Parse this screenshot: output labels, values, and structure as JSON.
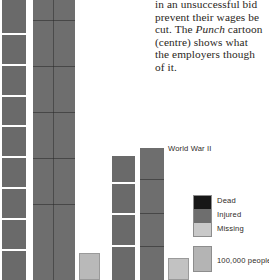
{
  "page": {
    "width": 269,
    "height": 280,
    "background": "#ffffff"
  },
  "body_text": {
    "lines": [
      "in an unsuccessful bid",
      "prevent their wages be",
      "cut. The Punch cartoon",
      "(centre) shows what",
      "the employers though",
      "of it."
    ],
    "italic_word": "Punch",
    "line3_pre": "cut. The ",
    "line3_post": " cartoon",
    "color": "#2a2622"
  },
  "annotations": {
    "world_war_2": "World War II"
  },
  "legend": {
    "items": [
      {
        "label": "Dead",
        "color": "#171717"
      },
      {
        "label": "Injured",
        "color": "#6e6e6e"
      },
      {
        "label": "Missing",
        "color": "#c9c9c9"
      }
    ],
    "scale": {
      "label": "100,000 people",
      "color": "#b4b4b4"
    }
  },
  "chart_data": {
    "type": "bar",
    "title": "",
    "xlabel": "",
    "ylabel": "",
    "unit": "100,000 people",
    "categories": [
      "World War I - Dead",
      "World War I - Injured",
      "World War I - Missing",
      "World War II - Dead",
      "World War II - Injured",
      "World War II - Missing"
    ],
    "series": [
      {
        "name": "Dead",
        "values": [
          90,
          null,
          null,
          39,
          null,
          null
        ]
      },
      {
        "name": "Injured",
        "values": [
          null,
          210,
          null,
          null,
          41,
          null
        ]
      },
      {
        "name": "Missing",
        "values": [
          null,
          null,
          4,
          null,
          null,
          3
        ]
      }
    ],
    "bars": [
      {
        "name": "ww1-dead",
        "category": "World War I",
        "series": "Dead",
        "color": "#6a6a6a",
        "x": 2,
        "width": 24,
        "top": 0,
        "height": 280,
        "style": "units",
        "segments": [
          34,
          30,
          30,
          30,
          30,
          30,
          30,
          30,
          30
        ],
        "value_units": 90
      },
      {
        "name": "ww1-injured",
        "category": "World War I",
        "series": "Injured",
        "color": "#6e6e6e",
        "x": 33,
        "width": 42,
        "top": 0,
        "height": 280,
        "style": "solid",
        "segments": [
          20,
          46,
          46,
          46,
          46,
          76
        ],
        "vrule_x": 20,
        "value_units": 210
      },
      {
        "name": "ww1-missing",
        "category": "World War I",
        "series": "Missing",
        "color": "#b9b9b9",
        "x": 79,
        "width": 21,
        "top": 253,
        "height": 27,
        "style": "light",
        "value_units": 4
      },
      {
        "name": "ww2-dead",
        "category": "World War II",
        "series": "Dead",
        "color": "#6a6a6a",
        "x": 112,
        "width": 23,
        "top": 156,
        "height": 124,
        "style": "units",
        "segments": [
          26,
          30,
          30,
          34
        ],
        "value_units": 39
      },
      {
        "name": "ww2-injured",
        "category": "World War II",
        "series": "Injured",
        "color": "#6e6e6e",
        "x": 140,
        "width": 24,
        "top": 148,
        "height": 132,
        "style": "solid",
        "segments": [
          32,
          33,
          33,
          34
        ],
        "vrule_x": 0,
        "value_units": 41
      },
      {
        "name": "ww2-missing",
        "category": "World War II",
        "series": "Missing",
        "color": "#c2c2c2",
        "x": 168,
        "width": 21,
        "top": 258,
        "height": 22,
        "style": "light",
        "value_units": 3
      }
    ]
  }
}
